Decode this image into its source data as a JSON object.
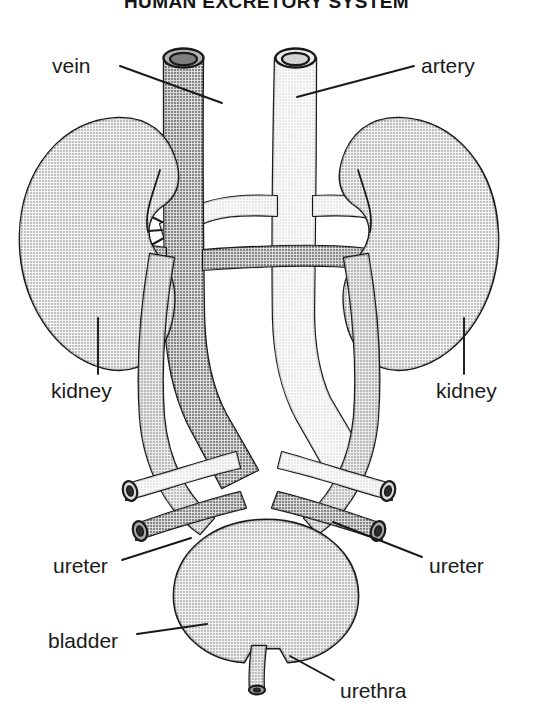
{
  "figure": {
    "title": "HUMAN EXCRETORY SYSTEM",
    "width": 533,
    "height": 715,
    "background": "#ffffff",
    "style": "black-and-white halftone textbook illustration"
  },
  "palette": {
    "outline": "#1a1a1a",
    "kidney_fill": "#c9c9c9",
    "bladder_fill": "#c6c6c6",
    "vein_fill": "#a3a3a3",
    "artery_fill": "#e2e2e2",
    "ureter_fill": "#b4b4b4",
    "lumen_dark": "#4a4a4a",
    "label_color": "#1a1a1a"
  },
  "labels": [
    {
      "id": "vein",
      "text": "vein",
      "side": "left",
      "text_x": 52,
      "text_y": 55,
      "leader": {
        "x1": 120,
        "y1": 66,
        "x2": 222,
        "y2": 103
      }
    },
    {
      "id": "artery",
      "text": "artery",
      "side": "right",
      "text_x": 421,
      "text_y": 55,
      "leader": {
        "x1": 414,
        "y1": 66,
        "x2": 297,
        "y2": 97
      }
    },
    {
      "id": "kidney-left",
      "text": "kidney",
      "side": "left",
      "text_x": 51,
      "text_y": 380,
      "leader": {
        "x1": 98,
        "y1": 374,
        "x2": 98,
        "y2": 318
      }
    },
    {
      "id": "kidney-right",
      "text": "kidney",
      "side": "right",
      "text_x": 436,
      "text_y": 380,
      "leader": {
        "x1": 464,
        "y1": 374,
        "x2": 464,
        "y2": 318
      }
    },
    {
      "id": "ureter-left",
      "text": "ureter",
      "side": "left",
      "text_x": 53,
      "text_y": 555,
      "leader": {
        "x1": 122,
        "y1": 560,
        "x2": 191,
        "y2": 538
      }
    },
    {
      "id": "ureter-right",
      "text": "ureter",
      "side": "right",
      "text_x": 429,
      "text_y": 555,
      "leader": {
        "x1": 422,
        "y1": 557,
        "x2": 333,
        "y2": 522
      }
    },
    {
      "id": "bladder",
      "text": "bladder",
      "side": "left",
      "text_x": 48,
      "text_y": 630,
      "leader": {
        "x1": 137,
        "y1": 634,
        "x2": 207,
        "y2": 624
      }
    },
    {
      "id": "urethra",
      "text": "urethra",
      "side": "right",
      "text_x": 340,
      "text_y": 680,
      "leader": {
        "x1": 334,
        "y1": 680,
        "x2": 290,
        "y2": 656
      }
    }
  ],
  "structures": [
    {
      "id": "vein-trunk",
      "name": "inferior vena cava",
      "label": "vein",
      "tone": "medium gray"
    },
    {
      "id": "artery-trunk",
      "name": "aorta",
      "label": "artery",
      "tone": "light gray"
    },
    {
      "id": "kidney-left-organ",
      "name": "left kidney",
      "label": "kidney",
      "tone": "light gray"
    },
    {
      "id": "kidney-right-organ",
      "name": "right kidney",
      "label": "kidney",
      "tone": "light gray"
    },
    {
      "id": "ureter-left-tube",
      "name": "left ureter",
      "label": "ureter",
      "tone": "medium gray"
    },
    {
      "id": "ureter-right-tube",
      "name": "right ureter",
      "label": "ureter",
      "tone": "medium gray"
    },
    {
      "id": "bladder-organ",
      "name": "urinary bladder",
      "label": "bladder",
      "tone": "light gray"
    },
    {
      "id": "urethra-tube",
      "name": "urethra",
      "label": "urethra",
      "tone": "medium gray"
    }
  ]
}
